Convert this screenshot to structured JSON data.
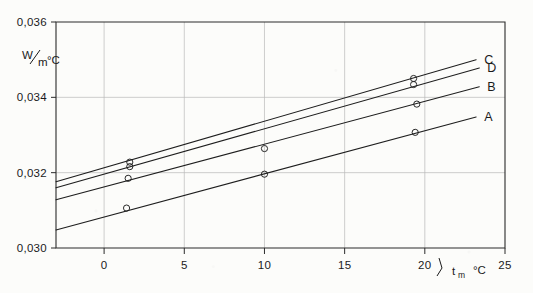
{
  "chart_data": {
    "type": "line",
    "title": "",
    "xlabel": "t_m °C",
    "xlabel_main": "t",
    "xlabel_sub": "m",
    "xlabel_unit": "°C",
    "ylabel": "W/m °C",
    "ylabel_numerator": "W",
    "ylabel_denominator": "m",
    "ylabel_unit": "°C",
    "xlim": [
      -3,
      25
    ],
    "ylim": [
      0.03,
      0.036
    ],
    "xticks": [
      0,
      5,
      10,
      15,
      20,
      25
    ],
    "xtick_labels": [
      "0",
      "5",
      "10",
      "15",
      "20",
      "25"
    ],
    "yticks": [
      0.03,
      0.032,
      0.034,
      0.036
    ],
    "ytick_labels": [
      "0,030",
      "0,032",
      "0,034",
      "0,036"
    ],
    "grid": true,
    "legend_position": "right-inline",
    "marker": "open-circle",
    "series": [
      {
        "name": "A",
        "label": "A",
        "endpoints": [
          {
            "x": -3,
            "y": 0.03048
          },
          {
            "x": 23.2,
            "y": 0.03348
          }
        ],
        "points": [
          {
            "x": 1.4,
            "y": 0.03106
          },
          {
            "x": 10.0,
            "y": 0.03196
          },
          {
            "x": 19.4,
            "y": 0.03307
          }
        ]
      },
      {
        "name": "B",
        "label": "B",
        "endpoints": [
          {
            "x": -3,
            "y": 0.03128
          },
          {
            "x": 23.4,
            "y": 0.03428
          }
        ],
        "points": [
          {
            "x": 1.5,
            "y": 0.03185
          },
          {
            "x": 10.0,
            "y": 0.03264
          },
          {
            "x": 19.5,
            "y": 0.03382
          }
        ]
      },
      {
        "name": "D",
        "label": "D",
        "endpoints": [
          {
            "x": -3,
            "y": 0.0316
          },
          {
            "x": 23.4,
            "y": 0.03478
          }
        ],
        "points": [
          {
            "x": 1.6,
            "y": 0.03216
          },
          {
            "x": 19.3,
            "y": 0.03434
          }
        ]
      },
      {
        "name": "C",
        "label": "C",
        "endpoints": [
          {
            "x": -3,
            "y": 0.03176
          },
          {
            "x": 23.2,
            "y": 0.035
          }
        ],
        "points": [
          {
            "x": 1.6,
            "y": 0.03228
          },
          {
            "x": 19.3,
            "y": 0.0345
          }
        ]
      }
    ]
  }
}
